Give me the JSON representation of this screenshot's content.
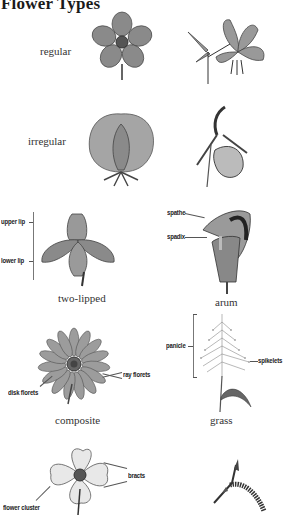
{
  "page": {
    "title": "Flower Types"
  },
  "rows": [
    {
      "label": "regular",
      "illustrations": [
        "regular-flower-top-view",
        "lily-side-view"
      ]
    },
    {
      "label": "irregular",
      "illustrations": [
        "irregular-flower-front-view",
        "lady-slipper-orchid"
      ]
    }
  ],
  "types": [
    {
      "caption": "two-lipped",
      "callouts": [
        "upper lip",
        "lower lip"
      ],
      "illustration": "two-lipped-flower"
    },
    {
      "caption": "arum",
      "callouts": [
        "spathe",
        "spadix"
      ],
      "illustration": "arum-flower"
    },
    {
      "caption": "composite",
      "callouts": [
        "ray florets",
        "disk florets"
      ],
      "illustration": "composite-flower"
    },
    {
      "caption": "grass",
      "callouts": [
        "panicle",
        "spikelets"
      ],
      "illustration": "grass-flower"
    },
    {
      "caption": "",
      "callouts": [
        "bracts",
        "flower cluster"
      ],
      "illustration": "dogwood-flower"
    },
    {
      "caption": "",
      "callouts": [],
      "illustration": "catkin"
    }
  ]
}
